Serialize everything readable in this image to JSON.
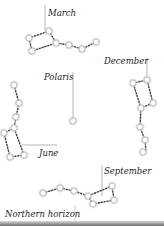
{
  "diagram": {
    "labels": {
      "march": "March",
      "december": "December",
      "polaris": "Polaris",
      "june": "June",
      "september": "September",
      "horizon": "Northern horizon"
    },
    "colors": {
      "star_core": "#ffffff",
      "star_glow": "#9a9a9a",
      "dots": "#3a3a3a",
      "leader_line": "#888888",
      "horizon": "#6b6b6b"
    },
    "polaris": {
      "x": 73,
      "y": 121
    },
    "constellations": {
      "march": {
        "stars": [
          [
            29,
            38
          ],
          [
            49,
            31
          ],
          [
            56,
            43
          ],
          [
            69,
            45
          ],
          [
            82,
            49
          ],
          [
            96,
            42
          ],
          [
            32,
            51
          ]
        ],
        "path": [
          [
            29,
            38
          ],
          [
            49,
            31
          ],
          [
            56,
            43
          ],
          [
            69,
            45
          ],
          [
            82,
            49
          ],
          [
            96,
            42
          ]
        ],
        "close": [
          [
            29,
            38
          ],
          [
            32,
            51
          ],
          [
            56,
            43
          ]
        ]
      },
      "december": {
        "stars": [
          [
            133,
            83
          ],
          [
            147,
            80
          ],
          [
            153,
            103
          ],
          [
            141,
            108
          ],
          [
            140,
            127
          ],
          [
            145,
            140
          ],
          [
            143,
            152
          ]
        ],
        "path": [
          [
            133,
            83
          ],
          [
            147,
            80
          ],
          [
            153,
            103
          ],
          [
            141,
            108
          ],
          [
            133,
            83
          ]
        ],
        "tail": [
          [
            141,
            108
          ],
          [
            140,
            127
          ],
          [
            145,
            140
          ],
          [
            146,
            152
          ]
        ]
      },
      "june": {
        "stars": [
          [
            14,
            85
          ],
          [
            19,
            103
          ],
          [
            16,
            117
          ],
          [
            14,
            128
          ],
          [
            4,
            133
          ],
          [
            10,
            157
          ],
          [
            24,
            155
          ]
        ],
        "path": [
          [
            14,
            85
          ],
          [
            19,
            103
          ],
          [
            16,
            117
          ],
          [
            14,
            128
          ],
          [
            24,
            155
          ],
          [
            10,
            157
          ],
          [
            4,
            133
          ],
          [
            14,
            128
          ]
        ]
      },
      "september": {
        "stars": [
          [
            43,
            193
          ],
          [
            60,
            188
          ],
          [
            74,
            191
          ],
          [
            88,
            196
          ],
          [
            93,
            204
          ],
          [
            112,
            186
          ],
          [
            114,
            200
          ]
        ],
        "path": [
          [
            43,
            193
          ],
          [
            60,
            188
          ],
          [
            74,
            191
          ],
          [
            88,
            196
          ],
          [
            112,
            186
          ],
          [
            114,
            200
          ],
          [
            93,
            204
          ],
          [
            88,
            196
          ]
        ]
      }
    }
  }
}
